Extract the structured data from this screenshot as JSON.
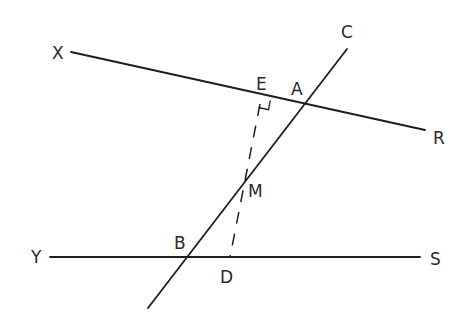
{
  "diagram": {
    "type": "geometry",
    "colors": {
      "stroke": "#1e1e1e",
      "text": "#2a2a2a",
      "background": "#ffffff"
    },
    "labels": {
      "X": "X",
      "E": "E",
      "A": "A",
      "C": "C",
      "R": "R",
      "M": "M",
      "B": "B",
      "D": "D",
      "Y": "Y",
      "S": "S"
    },
    "lines": [
      {
        "name": "XR",
        "from": "X",
        "to": "R",
        "style": "solid"
      },
      {
        "name": "YS",
        "from": "Y",
        "to": "S",
        "style": "solid"
      },
      {
        "name": "transversal",
        "through": [
          "C",
          "A",
          "M",
          "B"
        ],
        "style": "solid"
      },
      {
        "name": "ED",
        "from": "E",
        "to": "D",
        "through": "M",
        "style": "dashed"
      }
    ],
    "right_angle_at": "E"
  }
}
